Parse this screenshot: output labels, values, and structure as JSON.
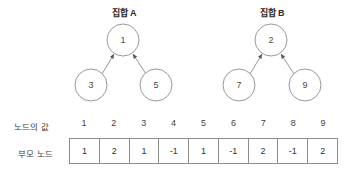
{
  "diagram": {
    "sets": [
      {
        "title": "집합 A",
        "title_x": 124,
        "root": {
          "value": "1",
          "cx": 123,
          "cy": 40,
          "r": 16
        },
        "children": [
          {
            "value": "3",
            "cx": 91,
            "cy": 85,
            "r": 16
          },
          {
            "value": "5",
            "cx": 156,
            "cy": 85,
            "r": 16
          }
        ]
      },
      {
        "title": "집합 B",
        "title_x": 272,
        "root": {
          "value": "2",
          "cx": 271,
          "cy": 40,
          "r": 16
        },
        "children": [
          {
            "value": "7",
            "cx": 239,
            "cy": 85,
            "r": 16
          },
          {
            "value": "9",
            "cx": 305,
            "cy": 85,
            "r": 16
          }
        ]
      }
    ],
    "edge_direction": "child-to-parent",
    "stroke_color": "#8d8d8d",
    "text_color": "#3f3f3f"
  },
  "table": {
    "row_labels": {
      "values": "노드의 값",
      "parents": "부모 노드"
    },
    "node_values": [
      "1",
      "2",
      "3",
      "4",
      "5",
      "6",
      "7",
      "8",
      "9"
    ],
    "parent_nodes": [
      "1",
      "2",
      "1",
      "-1",
      "1",
      "-1",
      "2",
      "-1",
      "2"
    ]
  }
}
